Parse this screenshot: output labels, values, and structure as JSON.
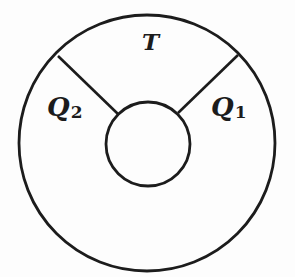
{
  "diagram": {
    "type": "annular-region-diagram",
    "stroke_color": "#1c1c1c",
    "background_color": "#fdfdfd",
    "outer_circle": {
      "cx": 147,
      "cy": 143,
      "r": 128
    },
    "inner_circle": {
      "cx": 148,
      "cy": 144,
      "r": 42
    },
    "dividers": [
      {
        "name": "left-divider",
        "x1": 58,
        "y1": 56,
        "x2": 118,
        "y2": 114
      },
      {
        "name": "right-divider",
        "x1": 238,
        "y1": 55,
        "x2": 178,
        "y2": 113
      }
    ],
    "regions": [
      {
        "name": "T",
        "label": "T",
        "subscript": ""
      },
      {
        "name": "Q2",
        "label": "Q",
        "subscript": "2"
      },
      {
        "name": "Q1",
        "label": "Q",
        "subscript": "1"
      }
    ]
  },
  "labels": {
    "top": {
      "main": "T"
    },
    "left": {
      "main": "Q",
      "sub": "2"
    },
    "right": {
      "main": "Q",
      "sub": "1"
    }
  }
}
